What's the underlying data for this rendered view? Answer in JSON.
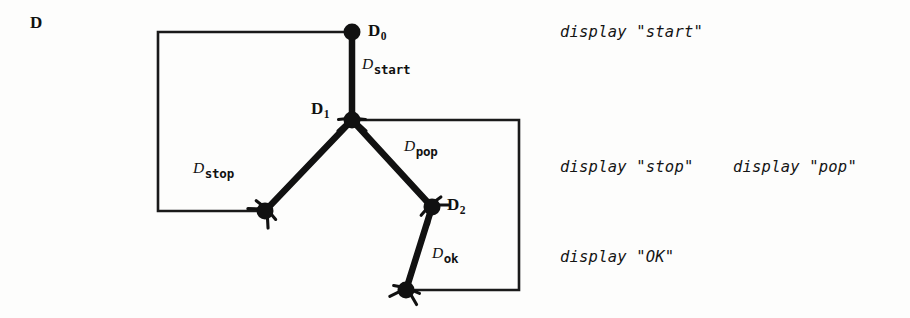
{
  "figure": {
    "corner_label": "D",
    "nodes": [
      {
        "id": "d0",
        "name_main": "D",
        "name_sub": "0",
        "cx": 352,
        "cy": 32,
        "label_x": 368,
        "label_y": 22
      },
      {
        "id": "d1",
        "name_main": "D",
        "name_sub": "1",
        "cx": 352,
        "cy": 120,
        "label_x": 311,
        "label_y": 100
      },
      {
        "id": "dstop",
        "name_main": "",
        "name_sub": "",
        "cx": 265,
        "cy": 211,
        "label_x": 0,
        "label_y": 0
      },
      {
        "id": "d2",
        "name_main": "D",
        "name_sub": "2",
        "cx": 432,
        "cy": 207,
        "label_x": 447,
        "label_y": 196
      },
      {
        "id": "dok",
        "name_main": "",
        "name_sub": "",
        "cx": 406,
        "cy": 290,
        "label_x": 0,
        "label_y": 0
      }
    ],
    "edges": [
      {
        "id": "start",
        "name_main": "D",
        "name_sub": "start",
        "label_x": 362,
        "label_y": 56,
        "from": "d0",
        "to": "d1"
      },
      {
        "id": "stop",
        "name_main": "D",
        "name_sub": "stop",
        "label_x": 193,
        "label_y": 160,
        "from": "d1",
        "to": "dstop"
      },
      {
        "id": "pop",
        "name_main": "D",
        "name_sub": "pop",
        "label_x": 404,
        "label_y": 138,
        "from": "d1",
        "to": "d2"
      },
      {
        "id": "ok",
        "name_main": "D",
        "name_sub": "ok",
        "label_x": 432,
        "label_y": 245,
        "from": "d2",
        "to": "dok"
      }
    ],
    "actions": [
      {
        "id": "start",
        "text": "display \"start\"",
        "x": 560,
        "y": 25
      },
      {
        "id": "stop",
        "text": "display \"stop\"",
        "x": 560,
        "y": 160
      },
      {
        "id": "pop",
        "text": "display \"pop\"",
        "x": 733,
        "y": 160
      },
      {
        "id": "ok",
        "text": "display \"OK\"",
        "x": 560,
        "y": 250
      }
    ],
    "colors": {
      "ink": "#111111",
      "paper": "#ffffff"
    }
  }
}
